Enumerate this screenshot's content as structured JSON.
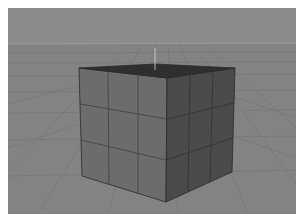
{
  "header": {
    "label": ""
  },
  "viewport": {
    "name": "3D Perspective Viewport",
    "background_color": "#8e8e8e",
    "sky_color": "#8c8c8c",
    "floor_color": "#838383",
    "grid_line_color": "#6f6f6f",
    "horizon_y": 36,
    "object": {
      "type": "cube",
      "subdivisions": 3,
      "top_face_color": "#2f2f2f",
      "front_face_color": "#6c6c6c",
      "right_face_color": "#4a4a4a",
      "edge_color": "#2a2a2a",
      "pivot_color": "#d8d8d8"
    }
  }
}
